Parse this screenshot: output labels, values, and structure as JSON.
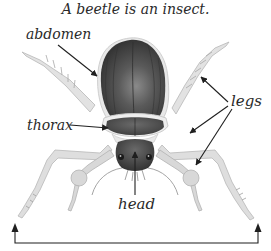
{
  "diagram": {
    "title": "A beetle is an insect.",
    "labels": {
      "abdomen": "abdomen",
      "thorax": "thorax",
      "legs": "legs",
      "head": "head"
    },
    "colors": {
      "body_dark": "#3d3d3d",
      "body_mid": "#5a5a5a",
      "body_highlight": "#8a8a8a",
      "leg_fill": "#dcdcdc",
      "leg_stroke": "#b5b5b5",
      "arrow": "#1f1f1f",
      "text": "#2a2a2a"
    }
  }
}
